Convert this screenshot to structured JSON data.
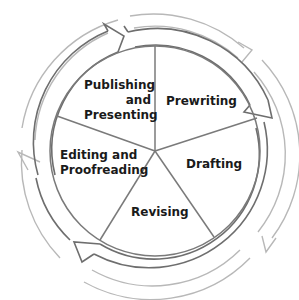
{
  "diagram": {
    "direction": "clockwise",
    "stages": [
      {
        "id": "prewriting",
        "label": "Prewriting",
        "lines": [
          "Prewriting"
        ]
      },
      {
        "id": "drafting",
        "label": "Drafting",
        "lines": [
          "Drafting"
        ]
      },
      {
        "id": "revising",
        "label": "Revising",
        "lines": [
          "Revising"
        ]
      },
      {
        "id": "editing",
        "label": "Editing and Proofreading",
        "lines": [
          "Editing and",
          "Proofreading"
        ]
      },
      {
        "id": "publishing",
        "label": "Publishing and Presenting",
        "lines": [
          "Publishing",
          "and",
          "Presenting"
        ]
      }
    ],
    "colors": {
      "divider": "#7a7a7a",
      "inner_ring": "#6e6e6e",
      "outer_ring": "#b5b5b5",
      "text": "#1a1a1a",
      "background": "#ffffff"
    }
  }
}
